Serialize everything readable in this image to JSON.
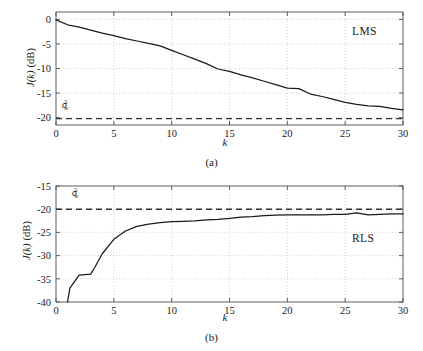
{
  "figure": {
    "panels": [
      {
        "id": "a",
        "caption": "(a)",
        "algorithm_label": "LMS",
        "sigma_label": {
          "symbol": "σ",
          "sub": "w",
          "sup": "2"
        }
      },
      {
        "id": "b",
        "caption": "(b)",
        "algorithm_label": "RLS",
        "sigma_label": {
          "symbol": "σ",
          "sub": "w",
          "sup": "2"
        }
      }
    ],
    "colors": {
      "curve": "#1a1a1a",
      "axis": "#4d4d4d",
      "grid": "#b3b3b3",
      "dashed_reference": "#333333",
      "background": "#ffffff"
    }
  },
  "chart_data": [
    {
      "type": "line",
      "panel": "a",
      "title": "",
      "annotation": "LMS",
      "xlabel": "k",
      "ylabel": "J(k) (dB)",
      "ylabel_parts": {
        "italic": "J(k)",
        "unit": "(dB)"
      },
      "xlim": [
        0,
        30
      ],
      "ylim": [
        -21.5,
        1.5
      ],
      "xticks": [
        0,
        5,
        10,
        15,
        20,
        25,
        30
      ],
      "xticklabels": [
        "0",
        "5",
        "10",
        "15",
        "20",
        "25",
        "30"
      ],
      "yticks": [
        0,
        -5,
        -10,
        -15,
        -20
      ],
      "yticklabels": [
        "0",
        "-5",
        "-10",
        "-15",
        "-20"
      ],
      "grid": true,
      "legend": "none",
      "reference_line": {
        "label": "σw²",
        "value": -20.2,
        "style": "dashed"
      },
      "x": [
        0,
        1,
        2,
        3,
        4,
        5,
        6,
        7,
        8,
        9,
        10,
        11,
        12,
        13,
        14,
        15,
        16,
        17,
        18,
        19,
        20,
        21,
        22,
        23,
        24,
        25,
        26,
        27,
        28,
        29,
        30
      ],
      "values": [
        -0.1,
        -1.1,
        -1.6,
        -2.2,
        -2.8,
        -3.3,
        -3.9,
        -4.4,
        -4.9,
        -5.4,
        -6.3,
        -7.2,
        -8.1,
        -9.0,
        -10.1,
        -10.6,
        -11.3,
        -11.9,
        -12.6,
        -13.3,
        -14.0,
        -14.1,
        -15.2,
        -15.7,
        -16.3,
        -16.9,
        -17.3,
        -17.6,
        -17.7,
        -18.1,
        -18.4
      ]
    },
    {
      "type": "line",
      "panel": "b",
      "title": "",
      "annotation": "RLS",
      "xlabel": "k",
      "ylabel": "J(k) (dB)",
      "ylabel_parts": {
        "italic": "J(k)",
        "unit": "(dB)"
      },
      "xlim": [
        0,
        30
      ],
      "ylim": [
        -40,
        -15
      ],
      "xticks": [
        0,
        5,
        10,
        15,
        20,
        25,
        30
      ],
      "xticklabels": [
        "0",
        "5",
        "10",
        "15",
        "20",
        "25",
        "30"
      ],
      "yticks": [
        -15,
        -20,
        -25,
        -30,
        -35,
        -40
      ],
      "yticklabels": [
        "-15",
        "-20",
        "-25",
        "-30",
        "-35",
        "-40"
      ],
      "grid": true,
      "legend": "none",
      "reference_line": {
        "label": "σw²",
        "value": -20.0,
        "style": "dashed"
      },
      "x": [
        1,
        1.2,
        2,
        3,
        3.2,
        4,
        5,
        6,
        7,
        8,
        9,
        10,
        11,
        12,
        13,
        14,
        15,
        16,
        17,
        18,
        19,
        20,
        21,
        22,
        23,
        24,
        25,
        26,
        27,
        28,
        29,
        30
      ],
      "values": [
        -40.0,
        -37.0,
        -34.2,
        -34.0,
        -33.2,
        -29.6,
        -26.5,
        -24.7,
        -23.7,
        -23.2,
        -22.9,
        -22.7,
        -22.6,
        -22.5,
        -22.3,
        -22.2,
        -22.0,
        -21.7,
        -21.6,
        -21.4,
        -21.3,
        -21.2,
        -21.2,
        -21.2,
        -21.2,
        -21.1,
        -21.1,
        -20.8,
        -21.2,
        -21.1,
        -21.0,
        -21.0
      ]
    }
  ]
}
